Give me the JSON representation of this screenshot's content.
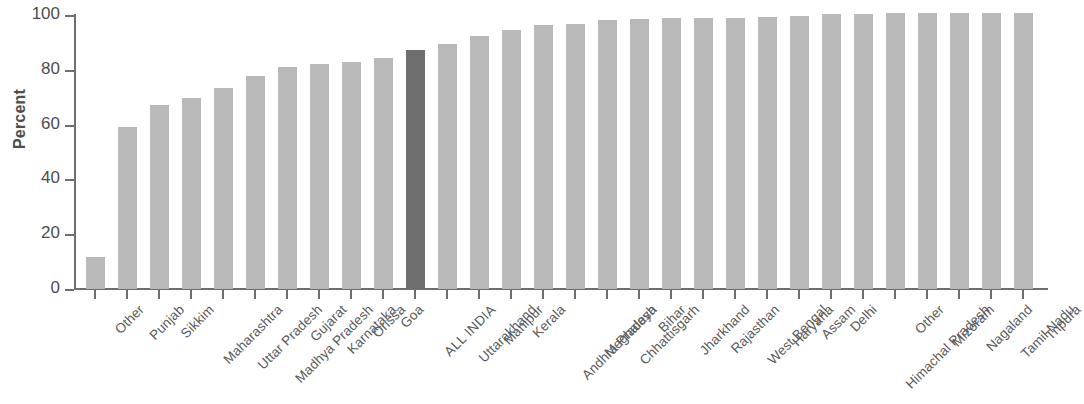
{
  "chart_data": {
    "type": "bar",
    "title": "",
    "xlabel": "",
    "ylabel": "Percent",
    "ylim": [
      0,
      100
    ],
    "yticks": [
      0,
      20,
      40,
      60,
      80,
      100
    ],
    "grid": false,
    "legend": null,
    "highlight_category": "ALL INDIA",
    "categories": [
      "Other",
      "Punjab",
      "Sikkim",
      "Maharashtra",
      "Uttar Pradesh",
      "Madhya Pradesh",
      "Gujarat",
      "Karnataka",
      "Orissa",
      "Goa",
      "ALL INDIA",
      "Uttarakhand",
      "Manipur",
      "Kerala",
      "Andhra Pradesh",
      "Meghalaya",
      "Chhattisgarh",
      "Bihar",
      "Jharkhand",
      "Rajasthan",
      "West Bengal",
      "Haryana",
      "Assam",
      "Delhi",
      "Himachal Pradesh",
      "Other",
      "Mizoram",
      "Nagaland",
      "Tamil Nadu",
      "Tripura"
    ],
    "values": [
      11.7,
      59.0,
      67.0,
      69.8,
      73.2,
      77.8,
      81.2,
      82.0,
      83.0,
      84.3,
      87.2,
      89.5,
      92.3,
      94.4,
      96.2,
      96.6,
      98.0,
      98.7,
      98.8,
      98.8,
      98.9,
      99.3,
      99.8,
      100.2,
      100.5,
      100.6,
      100.7,
      100.7,
      100.8,
      100.9
    ]
  },
  "axis": {
    "y_label": "Percent",
    "y_tick_labels": [
      "100",
      "80",
      "60",
      "40",
      "20",
      "0"
    ]
  }
}
